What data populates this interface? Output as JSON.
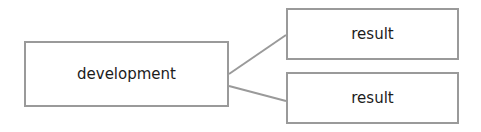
{
  "diagram": {
    "type": "tree",
    "colors": {
      "border": "#9a9a9a",
      "line": "#9a9a9a",
      "text": "#1c1c1c",
      "background": "#ffffff"
    },
    "nodes": [
      {
        "id": "development",
        "label": "development"
      },
      {
        "id": "result1",
        "label": "result"
      },
      {
        "id": "result2",
        "label": "result"
      }
    ],
    "edges": [
      {
        "from": "development",
        "to": "result1"
      },
      {
        "from": "development",
        "to": "result2"
      }
    ]
  }
}
